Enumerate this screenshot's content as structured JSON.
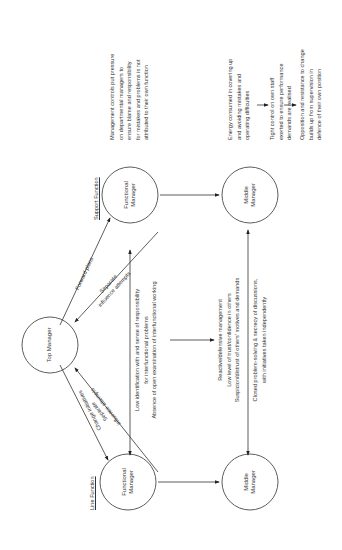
{
  "diagram": {
    "orientation": "rotated 90 degrees counter-clockwise",
    "sections": {
      "line_function": "Line Function",
      "support_function": "Support Function"
    },
    "nodes": {
      "top_manager": "Top Manager",
      "line_functional_manager": [
        "Functional",
        "Manager"
      ],
      "line_middle_manager": [
        "Middle",
        "Manager"
      ],
      "support_functional_manager": [
        "Functional",
        "Manager"
      ],
      "support_middle_manager": [
        "Middle",
        "Manager"
      ]
    },
    "edges": {
      "top_to_line_fm": "Change initiatives",
      "line_fm_to_top": [
        "Separate",
        "influence attempts"
      ],
      "top_to_support_fm": "Forward plans",
      "support_fm_to_top": [
        "Separate",
        "influence attempts"
      ]
    },
    "center_upper_block": [
      "Low identification with and sense of responsibility",
      "for interfunctional problems",
      "Absence of open examination of interfunctional working"
    ],
    "center_lower_block": [
      "Reactive/defensive management",
      "Low level of trust/confidence in others",
      "Suspicion/distrust of others' motives and demands",
      "Closed problem-solving & secrecy of discussions,",
      "with initiatives taken independently"
    ],
    "right_note": [
      "Management controls put pressure",
      "on departmental managers to",
      "ensure blame and responsibility",
      "for mistakes and problems is not",
      "attributed to their own function"
    ],
    "right_chain": [
      [
        "Energy consumed in covering up",
        "and avoiding mistakes and",
        "operating difficulties"
      ],
      [
        "Tight control on own staff",
        "exerted to ensure performance",
        "demands are realised"
      ],
      [
        "Opposition and resistance to change",
        "builds up from supervision in",
        "defence of their own position"
      ]
    ]
  }
}
